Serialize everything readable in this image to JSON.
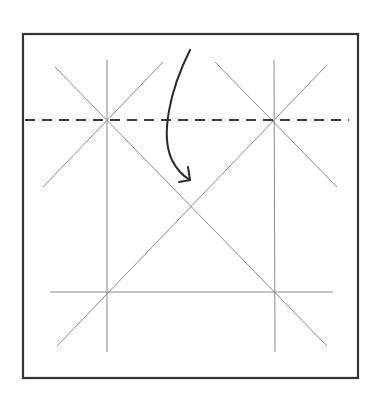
{
  "diagram": {
    "type": "origami-fold-step",
    "colors": {
      "background": "#ffffff",
      "frame": "#333333",
      "crease": "#8a8a8a",
      "fold_line": "#3a3a3a",
      "arrow": "#2a2a2a"
    },
    "paper": {
      "x1": 23,
      "y1": 34,
      "x2": 358,
      "y2": 378
    },
    "creases": [
      {
        "name": "vertical-crease-left",
        "x1": 107,
        "y1": 60,
        "x2": 107,
        "y2": 352
      },
      {
        "name": "vertical-crease-right",
        "x1": 274,
        "y1": 60,
        "x2": 275,
        "y2": 352
      },
      {
        "name": "horizontal-crease-bottom",
        "x1": 50,
        "y1": 292,
        "x2": 333,
        "y2": 292
      },
      {
        "name": "diagonal-crease-long-1",
        "x1": 55,
        "y1": 67,
        "x2": 327,
        "y2": 346
      },
      {
        "name": "diagonal-crease-long-2",
        "x1": 326,
        "y1": 66,
        "x2": 57,
        "y2": 346
      },
      {
        "name": "diagonal-crease-short-left",
        "x1": 163,
        "y1": 62,
        "x2": 43,
        "y2": 187
      },
      {
        "name": "diagonal-crease-short-right",
        "x1": 215,
        "y1": 62,
        "x2": 337,
        "y2": 187
      }
    ],
    "fold_line": {
      "name": "valley-fold-line",
      "x1": 25,
      "y1": 120,
      "x2": 349,
      "y2": 120,
      "dash": "10 7"
    },
    "arrow": {
      "name": "fold-direction-arrow",
      "path": "M190,50 C170,90 160,135 172,160 C177,170 183,176 190,180",
      "head": "M188,167 L190,180 L179,182"
    }
  }
}
